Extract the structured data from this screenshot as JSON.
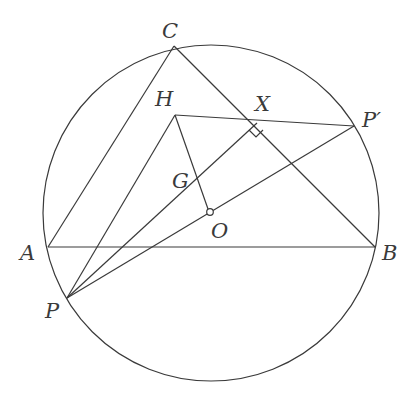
{
  "diagram": {
    "type": "geometry-figure",
    "circle": {
      "name": "circumcircle",
      "center": "O"
    },
    "points": [
      {
        "id": "C",
        "label": "C"
      },
      {
        "id": "H",
        "label": "H"
      },
      {
        "id": "X",
        "label": "X"
      },
      {
        "id": "Pp",
        "label": "P′"
      },
      {
        "id": "G",
        "label": "G"
      },
      {
        "id": "O",
        "label": "O"
      },
      {
        "id": "A",
        "label": "A"
      },
      {
        "id": "B",
        "label": "B"
      },
      {
        "id": "P",
        "label": "P"
      }
    ],
    "segments": [
      [
        "A",
        "B"
      ],
      [
        "B",
        "C"
      ],
      [
        "C",
        "A"
      ],
      [
        "H",
        "Pp"
      ],
      [
        "H",
        "O"
      ],
      [
        "P",
        "H"
      ],
      [
        "P",
        "X"
      ],
      [
        "P",
        "Pp"
      ]
    ],
    "right_angle_at": "X",
    "marked_point": "O"
  }
}
